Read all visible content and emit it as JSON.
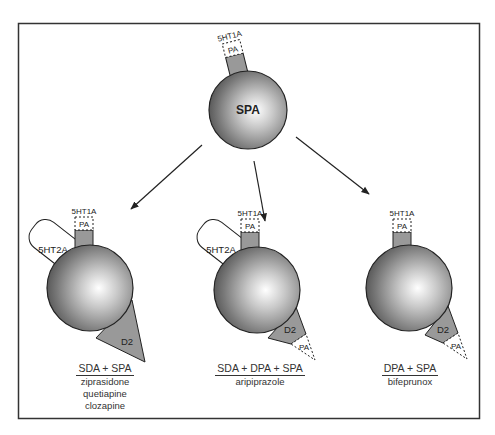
{
  "diagram": {
    "type": "receptor-binding-profile",
    "colors": {
      "frame": "#333333",
      "sphere_light": "#ffffff",
      "sphere_dark": "#555555",
      "receptor_fill": "#999999",
      "pill_fill": "#ffffff",
      "line": "#222222"
    },
    "top_node": {
      "sphere_label": "SPA",
      "receptor_label": "5HT1A",
      "partial_label": "PA"
    },
    "nodes": [
      {
        "id": "left",
        "receptors": {
          "5ht1a": "5HT1A",
          "5ht1a_pa": "PA",
          "5ht2a": "5HT2A",
          "d2": "D2"
        },
        "caption_heading": "SDA + SPA",
        "drugs": [
          "ziprasidone",
          "quetiapine",
          "clozapine"
        ]
      },
      {
        "id": "middle",
        "receptors": {
          "5ht1a": "5HT1A",
          "5ht1a_pa": "PA",
          "5ht2a": "5HT2A",
          "d2": "D2",
          "d2_pa": "PA"
        },
        "caption_heading": "SDA + DPA + SPA",
        "drugs": [
          "aripiprazole"
        ]
      },
      {
        "id": "right",
        "receptors": {
          "5ht1a": "5HT1A",
          "5ht1a_pa": "PA",
          "d2": "D2",
          "d2_pa": "PA"
        },
        "caption_heading": "DPA + SPA",
        "drugs": [
          "bifeprunox"
        ]
      }
    ]
  }
}
